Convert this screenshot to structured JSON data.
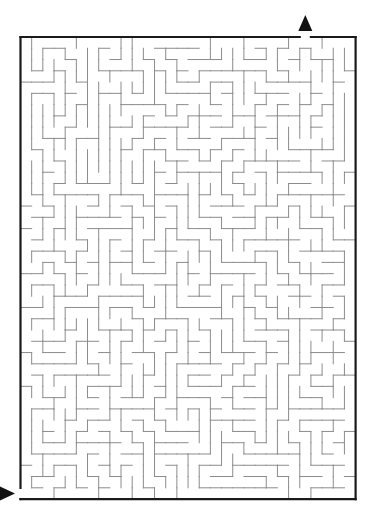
{
  "title_fragment": "",
  "maze": {
    "origin_x": 20.5,
    "origin_y": 37,
    "cols": 30,
    "rows": 41,
    "cell_w": 11.17,
    "cell_h": 11.27,
    "seed": 7193,
    "wall_color": "#8c8c8c",
    "border_color": "#1a1a1a",
    "border_width": 2.2,
    "wall_width": 1
  },
  "entrance": {
    "label": "start",
    "side": "left",
    "row": 40,
    "arrow": "right",
    "arrow_color": "#111111"
  },
  "exit": {
    "label": "finish",
    "side": "top",
    "col": 25,
    "arrow": "up",
    "arrow_color": "#111111"
  }
}
